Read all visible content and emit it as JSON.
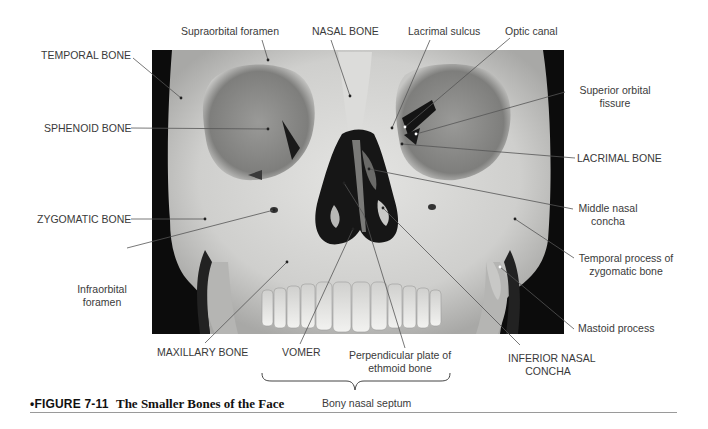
{
  "figure": {
    "number": "•FIGURE 7-11",
    "title": "The Smaller Bones of the Face"
  },
  "labels": {
    "supraorbital_foramen": "Supraorbital foramen",
    "nasal_bone": "NASAL BONE",
    "lacrimal_sulcus": "Lacrimal sulcus",
    "optic_canal": "Optic canal",
    "temporal_bone": "TEMPORAL BONE",
    "sphenoid_bone": "SPHENOID BONE",
    "superior_orbital_fissure_1": "Superior orbital",
    "superior_orbital_fissure_2": "fissure",
    "lacrimal_bone": "LACRIMAL BONE",
    "zygomatic_bone": "ZYGOMATIC BONE",
    "middle_nasal_concha_1": "Middle nasal",
    "middle_nasal_concha_2": "concha",
    "infraorbital_foramen_1": "Infraorbital",
    "infraorbital_foramen_2": "foramen",
    "temporal_process_1": "Temporal process of",
    "temporal_process_2": "zygomatic bone",
    "mastoid_process": "Mastoid process",
    "maxillary_bone": "MAXILLARY BONE",
    "vomer": "VOMER",
    "perpendicular_plate_1": "Perpendicular plate of",
    "perpendicular_plate_2": "ethmoid bone",
    "inferior_nasal_concha_1": "INFERIOR NASAL",
    "inferior_nasal_concha_2": "CONCHA",
    "bony_nasal_septum": "Bony nasal septum"
  },
  "colors": {
    "background": "#ffffff",
    "photo_bg": "#0c0c0c",
    "bone": "#d8d8d6",
    "bone_shadow": "#a9a9a7",
    "orbit": "#8f8f8d",
    "cavity": "#161616",
    "leader_line": "#555555",
    "text": "#3a3a3a",
    "rule": "#9a9a9a"
  }
}
